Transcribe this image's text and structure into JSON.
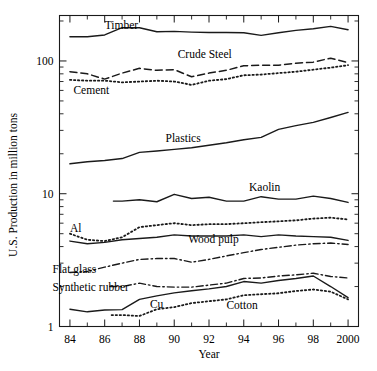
{
  "chart_data": {
    "type": "line",
    "title": "",
    "xlabel": "Year",
    "ylabel": "U.S. Production in million tons",
    "yscale": "log",
    "ylim": [
      1,
      220
    ],
    "xlim": [
      83.4,
      100.6
    ],
    "grid": false,
    "legend": "inline-labels",
    "y_tick_labels": [
      "100",
      "10",
      "1"
    ],
    "y_tick_values": [
      100,
      10,
      1
    ],
    "y_minor_ticks": [
      2,
      3,
      4,
      5,
      6,
      7,
      8,
      9,
      20,
      30,
      40,
      50,
      60,
      70,
      80,
      90,
      200
    ],
    "x_tick_labels": [
      "84",
      "86",
      "88",
      "90",
      "92",
      "94",
      "96",
      "98",
      "2000"
    ],
    "x_tick_values": [
      84,
      86,
      88,
      90,
      92,
      94,
      96,
      98,
      100
    ],
    "x_minor_ticks": [
      85,
      87,
      89,
      91,
      93,
      95,
      97,
      99
    ],
    "x": [
      84,
      85,
      86,
      87,
      88,
      89,
      90,
      91,
      92,
      93,
      94,
      95,
      96,
      97,
      98,
      99,
      100
    ],
    "series": [
      {
        "name": "Timber",
        "style": "solid",
        "label_x": 86.0,
        "label_y": 185,
        "values": [
          152,
          152,
          157,
          178,
          178,
          166,
          167,
          165,
          164,
          164,
          163,
          156,
          163,
          170,
          175,
          182,
          172
        ]
      },
      {
        "name": "Crude Steel",
        "style": "dashed",
        "label_x": 90.2,
        "label_y": 112,
        "values": [
          83,
          80,
          73,
          81,
          88,
          85,
          86,
          76,
          81,
          85,
          92,
          93,
          93,
          96,
          98,
          105,
          97
        ]
      },
      {
        "name": "Cement",
        "style": "dotted",
        "label_x": 84.2,
        "label_y": 60,
        "values": [
          72,
          71,
          71,
          69,
          70,
          71,
          70,
          66,
          71,
          73,
          78,
          79,
          81,
          83,
          86,
          89,
          93
        ]
      },
      {
        "name": "Plastics",
        "style": "solid",
        "label_x": 89.5,
        "label_y": 26.5,
        "values": [
          16.8,
          17.4,
          17.8,
          18.4,
          20.5,
          21.0,
          21.6,
          22.2,
          23.2,
          24.2,
          25.5,
          26.6,
          30.5,
          32.6,
          34.5,
          37.5,
          41.0
        ]
      },
      {
        "name": "Kaolin",
        "style": "solid",
        "label_x": 94.3,
        "label_y": 11.2,
        "x_start": 86.5,
        "values": [
          null,
          null,
          7.8,
          8.8,
          9.0,
          8.7,
          9.9,
          9.2,
          9.4,
          8.8,
          8.8,
          9.5,
          9.1,
          9.1,
          9.6,
          9.2,
          8.6
        ]
      },
      {
        "name": "Al",
        "style": "dotted",
        "label_x": 84.0,
        "label_y": 5.55,
        "values": [
          5.0,
          4.5,
          4.4,
          4.7,
          5.6,
          5.8,
          6.0,
          5.8,
          5.9,
          5.9,
          6.0,
          6.1,
          6.2,
          6.3,
          6.5,
          6.6,
          6.4
        ]
      },
      {
        "name": "Wood pulp",
        "style": "solid",
        "label_x": 90.8,
        "label_y": 4.6,
        "values": [
          4.4,
          4.2,
          4.3,
          4.5,
          4.6,
          4.7,
          4.9,
          4.8,
          4.8,
          4.8,
          4.9,
          4.75,
          4.9,
          4.8,
          4.75,
          4.7,
          4.45
        ]
      },
      {
        "name": "Flat glass",
        "style": "dashdot",
        "label_x": 83.0,
        "label_y": 2.72,
        "values": [
          2.55,
          2.6,
          2.8,
          3.0,
          3.2,
          3.25,
          3.25,
          3.05,
          3.2,
          3.4,
          3.6,
          3.8,
          3.95,
          4.1,
          4.2,
          4.25,
          4.15
        ]
      },
      {
        "name": "Synthetic rubber",
        "style": "dashdot",
        "label_x": 83.0,
        "label_y": 1.97,
        "x_start": 86.3,
        "values": [
          null,
          null,
          1.72,
          2.0,
          2.12,
          2.0,
          1.98,
          1.98,
          2.05,
          2.12,
          2.3,
          2.32,
          2.4,
          2.45,
          2.52,
          2.38,
          2.32
        ]
      },
      {
        "name": "Cu",
        "style": "solid",
        "label_x": 88.6,
        "label_y": 1.47,
        "values": [
          1.35,
          1.29,
          1.33,
          1.34,
          1.6,
          1.7,
          1.79,
          1.86,
          1.92,
          2.0,
          2.18,
          2.12,
          2.22,
          2.3,
          2.4,
          2.0,
          1.65
        ]
      },
      {
        "name": "Cotton",
        "style": "dotted",
        "label_x": 93.0,
        "label_y": 1.46,
        "x_start": 86.4,
        "values": [
          null,
          null,
          1.15,
          1.22,
          1.2,
          1.35,
          1.4,
          1.5,
          1.55,
          1.6,
          1.72,
          1.75,
          1.78,
          1.85,
          1.9,
          1.83,
          1.6
        ]
      }
    ]
  },
  "axes": {
    "x_title": "Year",
    "y_title": "U.S. Production in million tons"
  }
}
